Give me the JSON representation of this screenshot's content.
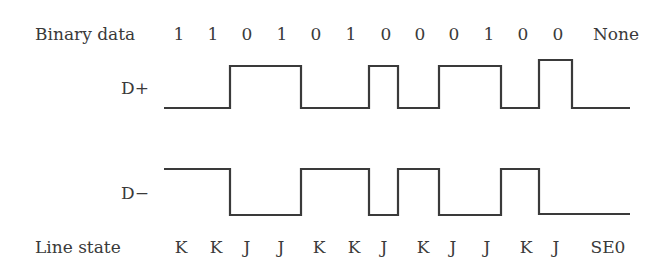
{
  "diagram": {
    "row_labels": {
      "binary": "Binary data",
      "dplus": "D+",
      "dminus": "D−",
      "line_state": "Line state"
    },
    "bits": [
      "1",
      "1",
      "0",
      "1",
      "0",
      "1",
      "0",
      "0",
      "0",
      "1",
      "0",
      "0",
      "None"
    ],
    "line_states": [
      "K",
      "K",
      "J",
      "J",
      "K",
      "K",
      "J",
      "K",
      "J",
      "J",
      "K",
      "J",
      "SE0"
    ],
    "dplus_levels": [
      "low",
      "low",
      "high",
      "high",
      "low",
      "low",
      "high",
      "low",
      "high",
      "high",
      "low",
      "high",
      "low"
    ],
    "dminus_levels": [
      "high",
      "high",
      "low",
      "low",
      "high",
      "high",
      "low",
      "high",
      "low",
      "low",
      "high",
      "low",
      "low"
    ],
    "line_color": "#3a3a3a"
  }
}
